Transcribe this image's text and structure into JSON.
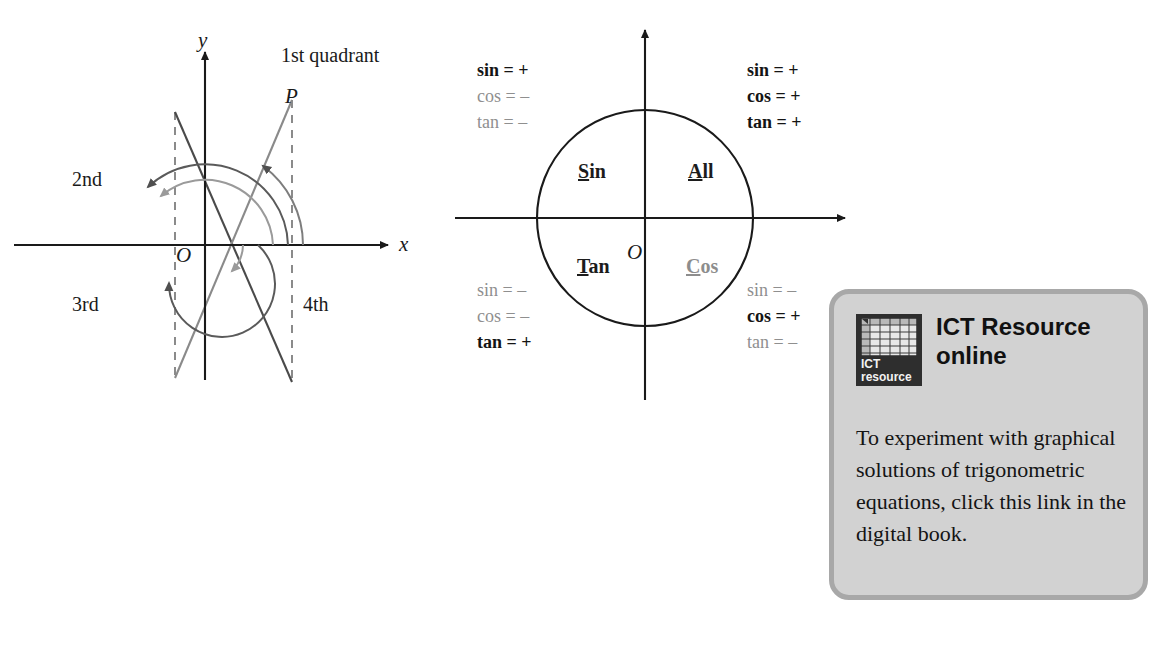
{
  "left_diagram": {
    "name": "quadrants-and-rotations-diagram",
    "axis_labels": {
      "x": "x",
      "y": "y",
      "origin": "O"
    },
    "point_label": "P",
    "quadrant_labels": {
      "first": "1st quadrant",
      "second": "2nd",
      "third": "3rd",
      "fourth": "4th"
    },
    "colors": {
      "axis": "#1a1a1a",
      "line_dark": "#4a4a4a",
      "line_gray": "#8a8a8a",
      "arc_dark": "#565656",
      "arc_gray": "#9a9a9a",
      "dashed": "#6e6e6e"
    }
  },
  "cast_diagram": {
    "name": "cast-rule-unit-circle",
    "origin_label": "O",
    "colors": {
      "axis": "#1a1a1a",
      "circle": "#1a1a1a",
      "positive": "#141414",
      "negative": "#8f8f8f"
    },
    "quadrant_words": [
      {
        "id": "all",
        "initial": "A",
        "rest": "ll",
        "emphasis": "dark"
      },
      {
        "id": "sin",
        "initial": "S",
        "rest": "in",
        "emphasis": "dark"
      },
      {
        "id": "tan",
        "initial": "T",
        "rest": "an",
        "emphasis": "dark"
      },
      {
        "id": "cos",
        "initial": "C",
        "rest": "os",
        "emphasis": "gray"
      }
    ],
    "signs": {
      "quadrant1": [
        {
          "fn": "sin",
          "eq": "=",
          "sign": "+",
          "state": "pos"
        },
        {
          "fn": "cos",
          "eq": "=",
          "sign": "+",
          "state": "pos"
        },
        {
          "fn": "tan",
          "eq": "=",
          "sign": "+",
          "state": "pos"
        }
      ],
      "quadrant2": [
        {
          "fn": "sin",
          "eq": "=",
          "sign": "+",
          "state": "pos"
        },
        {
          "fn": "cos",
          "eq": "=",
          "sign": "–",
          "state": "neg"
        },
        {
          "fn": "tan",
          "eq": "=",
          "sign": "–",
          "state": "neg"
        }
      ],
      "quadrant3": [
        {
          "fn": "sin",
          "eq": "=",
          "sign": "–",
          "state": "neg"
        },
        {
          "fn": "cos",
          "eq": "=",
          "sign": "–",
          "state": "neg"
        },
        {
          "fn": "tan",
          "eq": "=",
          "sign": "+",
          "state": "pos"
        }
      ],
      "quadrant4": [
        {
          "fn": "sin",
          "eq": "=",
          "sign": "–",
          "state": "neg"
        },
        {
          "fn": "cos",
          "eq": "=",
          "sign": "+",
          "state": "pos"
        },
        {
          "fn": "tan",
          "eq": "=",
          "sign": "–",
          "state": "neg"
        }
      ]
    }
  },
  "ict_panel": {
    "name": "ict-resource-online-callout",
    "icon": {
      "caption_line1": "ICT",
      "caption_line2": "resource",
      "grid_columns": [
        "A",
        "B",
        "C",
        "D",
        "E"
      ],
      "grid_rows": [
        "1",
        "2",
        "3",
        "4"
      ]
    },
    "title": "ICT Resource online",
    "body": "To experiment with graphical solutions of trigonometric equations, click this link in the digital book.",
    "colors": {
      "panel_fill": "#d2d2d2",
      "panel_border": "#a8a8a8",
      "icon_fill": "#2e2e2e",
      "text": "#141414"
    }
  }
}
